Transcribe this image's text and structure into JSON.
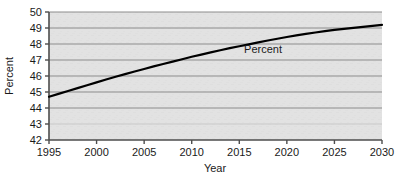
{
  "chart_data": {
    "type": "line",
    "title": "",
    "subtitle": "",
    "xlabel": "Year",
    "ylabel": "Percent",
    "xlim": [
      1995,
      2030
    ],
    "ylim": [
      42,
      50
    ],
    "xticks": [
      1995,
      2000,
      2005,
      2010,
      2015,
      2020,
      2025,
      2030
    ],
    "xtick_labels": [
      "1995",
      "2000",
      "2005",
      "2010",
      "2015",
      "2020",
      "2025",
      "2030"
    ],
    "yticks": [
      42,
      43,
      44,
      45,
      46,
      47,
      48,
      49,
      50
    ],
    "ytick_labels": [
      "42",
      "43",
      "44",
      "45",
      "46",
      "47",
      "48",
      "49",
      "50"
    ],
    "grid": true,
    "grid_orientation": "horizontal",
    "legend": "none",
    "annotations": [
      {
        "text": "Percent",
        "x": 2017.5,
        "y": 47.45
      }
    ],
    "series": [
      {
        "name": "Percent",
        "color": "#000000",
        "x": [
          1995,
          1996,
          1997,
          1998,
          1999,
          2000,
          2001,
          2002,
          2003,
          2004,
          2005,
          2006,
          2007,
          2008,
          2009,
          2010,
          2011,
          2012,
          2013,
          2014,
          2015,
          2016,
          2017,
          2018,
          2019,
          2020,
          2021,
          2022,
          2023,
          2024,
          2025,
          2026,
          2027,
          2028,
          2029,
          2030
        ],
        "values": [
          44.7,
          44.88,
          45.06,
          45.24,
          45.42,
          45.6,
          45.78,
          45.95,
          46.12,
          46.28,
          46.44,
          46.6,
          46.75,
          46.9,
          47.05,
          47.2,
          47.34,
          47.48,
          47.61,
          47.74,
          47.86,
          47.98,
          48.1,
          48.22,
          48.33,
          48.44,
          48.54,
          48.63,
          48.72,
          48.8,
          48.88,
          48.95,
          49.01,
          49.07,
          49.13,
          49.2
        ]
      }
    ],
    "colors": {
      "plot_background": "#e2e2e2",
      "grid_line": "#8c8c8c",
      "axis_line": "#4d4d4d",
      "line": "#000000",
      "text": "#1a1a1a",
      "page_background": "#ffffff"
    }
  }
}
